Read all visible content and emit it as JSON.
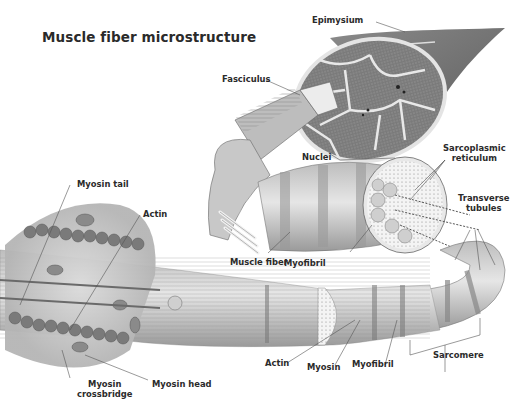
{
  "title": "Muscle fiber microstructure",
  "labels": {
    "epimysium": "Epimysium",
    "fasciculus": "Fasciculus",
    "nuclei": "Nuclei",
    "sarcoplasmic_reticulum_1": "Sarcoplasmic",
    "sarcoplasmic_reticulum_2": "reticulum",
    "transverse_tubules_1": "Transverse",
    "transverse_tubules_2": "tubules",
    "muscle_fiber": "Muscle fiber",
    "myofibril_upper": "Myofibril",
    "myosin_tail": "Myosin tail",
    "actin_upper": "Actin",
    "myosin_crossbridge_1": "Myosin",
    "myosin_crossbridge_2": "crossbridge",
    "myosin_head": "Myosin head",
    "actin_lower": "Actin",
    "myosin": "Myosin",
    "myofibril_lower": "Myofibril",
    "sarcomere": "Sarcomere"
  },
  "colors": {
    "ink": "#2b2b2b",
    "tissue_light": "#d9d9d9",
    "tissue_mid": "#a8a8a8",
    "tissue_dark": "#6e6e6e",
    "leader_line": "#555555"
  }
}
